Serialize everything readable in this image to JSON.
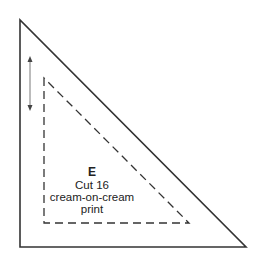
{
  "diagram": {
    "type": "quilt-template",
    "shape": "right-triangle",
    "piece": {
      "letter": "E",
      "cut_instruction": "Cut 16",
      "fabric_line1": "cream-on-cream",
      "fabric_line2": "print"
    },
    "outer_line": "solid (finished + seam allowance cutting line)",
    "inner_line": "dashed (sewing line)",
    "grain_arrow": "vertical double-headed arrow",
    "colors": {
      "stroke": "#333333",
      "background": "#ffffff"
    }
  }
}
